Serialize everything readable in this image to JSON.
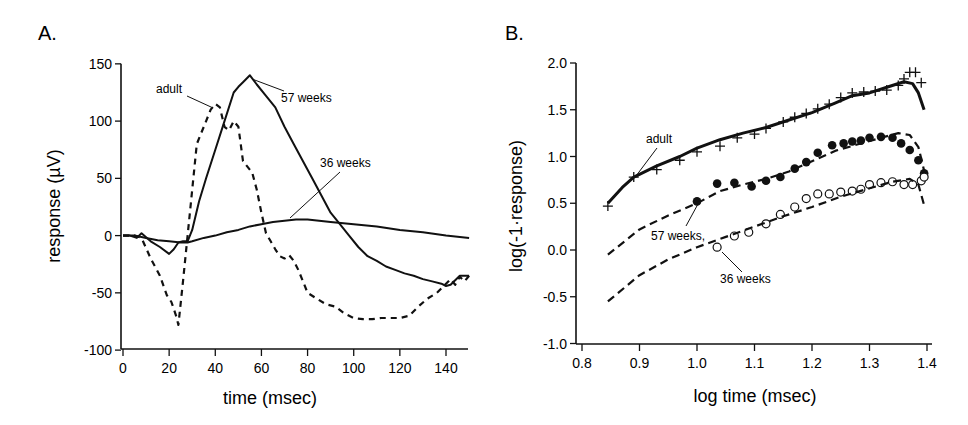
{
  "chart_data": [
    {
      "panel": "A.",
      "type": "line",
      "title": "",
      "xlabel": "time (msec)",
      "ylabel": "response (µV)",
      "xlim": [
        0,
        150
      ],
      "ylim": [
        -100,
        150
      ],
      "xticks": [
        0,
        20,
        40,
        60,
        80,
        100,
        120,
        140
      ],
      "yticks": [
        150,
        100,
        50,
        0,
        -50,
        -100
      ],
      "grid": false,
      "legend": "inline annotations",
      "annotations": [
        "adult",
        "57 weeks",
        "36 weeks"
      ],
      "series": [
        {
          "name": "adult",
          "style": "dashed",
          "x": [
            0,
            5,
            8,
            12,
            16,
            19,
            21,
            23,
            24,
            26,
            28,
            30,
            32,
            34,
            36,
            38,
            40,
            42,
            44,
            46,
            48,
            50,
            52,
            54,
            56,
            58,
            60,
            62,
            64,
            66,
            68,
            70,
            72,
            74,
            76,
            78,
            80,
            84,
            88,
            92,
            96,
            100,
            104,
            108,
            112,
            116,
            120,
            124,
            128,
            132,
            136,
            140,
            142,
            144,
            146,
            148,
            150
          ],
          "y": [
            0,
            0,
            -2,
            -20,
            -35,
            -52,
            -58,
            -70,
            -78,
            -40,
            0,
            40,
            80,
            90,
            100,
            110,
            115,
            112,
            95,
            92,
            100,
            95,
            65,
            60,
            55,
            40,
            20,
            2,
            -5,
            -12,
            -18,
            -20,
            -17,
            -22,
            -30,
            -40,
            -50,
            -55,
            -60,
            -62,
            -68,
            -72,
            -73,
            -73,
            -72,
            -72,
            -72,
            -70,
            -62,
            -55,
            -50,
            -42,
            -38,
            -43,
            -36,
            -40,
            -35
          ]
        },
        {
          "name": "57 weeks",
          "style": "solid",
          "x": [
            0,
            3,
            6,
            8,
            12,
            16,
            20,
            22,
            24,
            26,
            28,
            30,
            33,
            36,
            40,
            44,
            48,
            50,
            52,
            55,
            58,
            62,
            66,
            70,
            74,
            78,
            82,
            86,
            90,
            94,
            98,
            102,
            106,
            110,
            114,
            118,
            122,
            126,
            130,
            134,
            138,
            140,
            142,
            146,
            150
          ],
          "y": [
            0,
            0,
            -2,
            2,
            -5,
            -10,
            -16,
            -12,
            -6,
            -5,
            -5,
            5,
            30,
            50,
            75,
            100,
            125,
            130,
            134,
            140,
            132,
            122,
            112,
            95,
            80,
            65,
            50,
            35,
            20,
            10,
            0,
            -10,
            -18,
            -22,
            -27,
            -30,
            -33,
            -35,
            -38,
            -40,
            -42,
            -44,
            -43,
            -35,
            -35
          ]
        },
        {
          "name": "36 weeks",
          "style": "solid",
          "x": [
            0,
            5,
            10,
            15,
            20,
            25,
            28,
            30,
            35,
            40,
            45,
            50,
            55,
            60,
            65,
            70,
            75,
            80,
            90,
            100,
            110,
            120,
            130,
            140,
            150
          ],
          "y": [
            0,
            0,
            -2,
            -4,
            -5,
            -6,
            -6,
            -5,
            -2,
            0,
            3,
            5,
            8,
            10,
            12,
            13,
            14,
            14,
            12,
            10,
            8,
            5,
            3,
            0,
            -2
          ]
        }
      ]
    },
    {
      "panel": "B.",
      "type": "line+scatter",
      "title": "",
      "xlabel": "log time (msec)",
      "ylabel": "log(-1·response)",
      "xlim": [
        0.8,
        1.4
      ],
      "ylim": [
        -1.0,
        2.0
      ],
      "xticks": [
        "0.8",
        "0.9",
        "1.0",
        "1.1",
        "1.2",
        "1.3",
        "1.4"
      ],
      "yticks": [
        "2.0",
        "1.5",
        "1.0",
        "0.5",
        "0.0",
        "-0.5",
        "-1.0"
      ],
      "grid": false,
      "legend": "inline annotations",
      "annotations": [
        "adult",
        "57 weeks",
        "36 weeks"
      ],
      "series": [
        {
          "name": "adult data",
          "marker": "+",
          "x": [
            0.845,
            0.89,
            0.93,
            0.97,
            1.0,
            1.04,
            1.07,
            1.1,
            1.12,
            1.15,
            1.17,
            1.19,
            1.21,
            1.23,
            1.25,
            1.27,
            1.29,
            1.31,
            1.33,
            1.35,
            1.36,
            1.37,
            1.38,
            1.39
          ],
          "y": [
            0.47,
            0.78,
            0.86,
            0.96,
            1.05,
            1.11,
            1.2,
            1.24,
            1.3,
            1.37,
            1.42,
            1.46,
            1.51,
            1.56,
            1.63,
            1.68,
            1.69,
            1.7,
            1.71,
            1.76,
            1.83,
            1.9,
            1.9,
            1.79
          ]
        },
        {
          "name": "adult fit",
          "style": "solid",
          "x": [
            0.845,
            0.87,
            0.89,
            0.93,
            0.97,
            1.0,
            1.04,
            1.08,
            1.12,
            1.16,
            1.2,
            1.24,
            1.27,
            1.3,
            1.33,
            1.36,
            1.375,
            1.385,
            1.395
          ],
          "y": [
            0.5,
            0.67,
            0.78,
            0.9,
            1.0,
            1.09,
            1.18,
            1.25,
            1.31,
            1.39,
            1.47,
            1.57,
            1.65,
            1.68,
            1.74,
            1.8,
            1.78,
            1.68,
            1.5
          ]
        },
        {
          "name": "57 weeks data",
          "marker": "filled-circle",
          "x": [
            1.0,
            1.035,
            1.065,
            1.095,
            1.12,
            1.145,
            1.17,
            1.19,
            1.21,
            1.235,
            1.255,
            1.27,
            1.285,
            1.3,
            1.32,
            1.34,
            1.355,
            1.37,
            1.385,
            1.395
          ],
          "y": [
            0.52,
            0.71,
            0.72,
            0.68,
            0.74,
            0.78,
            0.87,
            0.94,
            1.04,
            1.12,
            1.14,
            1.16,
            1.17,
            1.2,
            1.21,
            1.2,
            1.14,
            1.07,
            0.96,
            0.82
          ]
        },
        {
          "name": "57 weeks fit",
          "style": "dashed",
          "x": [
            0.845,
            0.9,
            0.95,
            1.0,
            1.04,
            1.08,
            1.12,
            1.16,
            1.2,
            1.24,
            1.28,
            1.32,
            1.35,
            1.37,
            1.385,
            1.395
          ],
          "y": [
            -0.05,
            0.22,
            0.37,
            0.5,
            0.63,
            0.7,
            0.76,
            0.84,
            0.95,
            1.06,
            1.13,
            1.2,
            1.25,
            1.23,
            1.1,
            0.85
          ]
        },
        {
          "name": "36 weeks data",
          "marker": "open-circle",
          "x": [
            1.035,
            1.065,
            1.09,
            1.12,
            1.145,
            1.17,
            1.19,
            1.21,
            1.23,
            1.25,
            1.27,
            1.285,
            1.3,
            1.32,
            1.34,
            1.36,
            1.375,
            1.39,
            1.395
          ],
          "y": [
            0.03,
            0.15,
            0.19,
            0.28,
            0.38,
            0.46,
            0.55,
            0.6,
            0.6,
            0.62,
            0.63,
            0.65,
            0.7,
            0.72,
            0.73,
            0.7,
            0.7,
            0.74,
            0.78
          ]
        },
        {
          "name": "36 weeks fit",
          "style": "dashed",
          "x": [
            0.845,
            0.9,
            0.95,
            1.0,
            1.05,
            1.1,
            1.15,
            1.2,
            1.25,
            1.3,
            1.34,
            1.37,
            1.385,
            1.395
          ],
          "y": [
            -0.55,
            -0.27,
            -0.1,
            0.03,
            0.14,
            0.25,
            0.36,
            0.46,
            0.57,
            0.66,
            0.73,
            0.76,
            0.7,
            0.48
          ]
        }
      ]
    }
  ],
  "labels": {
    "panelA": "A.",
    "panelB": "B.",
    "A_xlabel": "time (msec)",
    "A_ylabel": "response (µV)",
    "B_xlabel": "log time (msec)",
    "B_ylabel": "log(-1·response)",
    "annot_adult": "adult",
    "annot_57": "57 weeks",
    "annot_36": "36 weeks",
    "annotB_57": "57 weeks,"
  }
}
